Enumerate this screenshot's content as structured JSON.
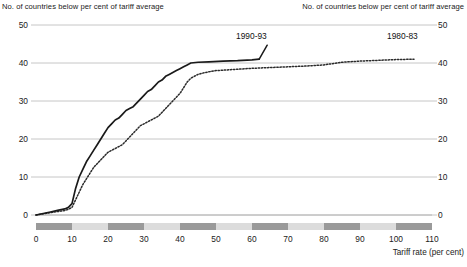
{
  "header": {
    "left_title": "No. of countries below per cent of tariff average",
    "right_title": "No. of countries below per cent of tariff average"
  },
  "axes": {
    "y_left_ticks": [
      "50",
      "40",
      "30",
      "20",
      "10",
      "0"
    ],
    "y_right_ticks": [
      "50",
      "40",
      "30",
      "20",
      "10",
      "0"
    ],
    "x_ticks": [
      "0",
      "10",
      "20",
      "30",
      "40",
      "50",
      "60",
      "70",
      "80",
      "90",
      "100",
      "110"
    ],
    "x_title": "Tariff rate (per cent)"
  },
  "series_labels": {
    "solid": "1990-93",
    "dotted": "1980-83"
  },
  "colors": {
    "line_solid": "#1a1a1a",
    "line_dotted": "#2b2b2b",
    "grid": "#b8b8b8",
    "band_dark": "#9a9a9a",
    "band_light": "#dcdcdc",
    "text": "#222222"
  },
  "chart_data": {
    "type": "line",
    "title": "No. of countries below per cent of tariff average",
    "xlabel": "Tariff rate (per cent)",
    "ylabel": "No. of countries below per cent of tariff average",
    "xlim": [
      0,
      110
    ],
    "ylim": [
      0,
      50
    ],
    "grid": true,
    "legend_position": "inline-annotation",
    "series": [
      {
        "name": "1990-93",
        "style": "solid",
        "x": [
          0,
          2,
          4,
          6,
          8,
          9,
          10,
          11,
          12,
          13,
          14,
          15,
          16,
          17,
          18,
          19,
          20,
          21,
          22,
          23,
          24,
          25,
          26,
          27,
          28,
          29,
          30,
          31,
          32,
          33,
          34,
          35,
          36,
          37,
          38,
          39,
          40,
          41,
          42,
          43,
          45,
          48,
          52,
          56,
          60,
          62
        ],
        "y": [
          0,
          0.4,
          0.8,
          1.2,
          1.6,
          2.0,
          3.0,
          7.0,
          10.0,
          12.0,
          14.0,
          15.5,
          17.0,
          18.5,
          20.0,
          21.5,
          23.0,
          24.0,
          25.0,
          25.5,
          26.5,
          27.5,
          28.0,
          28.5,
          29.5,
          30.5,
          31.5,
          32.5,
          33.0,
          34.0,
          35.0,
          35.5,
          36.5,
          37.0,
          37.5,
          38.0,
          38.5,
          39.0,
          39.5,
          40.0,
          40.2,
          40.3,
          40.5,
          40.6,
          40.8,
          41.0
        ]
      },
      {
        "name": "1980-83",
        "style": "dotted",
        "x": [
          0,
          2,
          4,
          6,
          8,
          9,
          10,
          11,
          12,
          13,
          14,
          15,
          16,
          17,
          18,
          19,
          20,
          21,
          22,
          23,
          24,
          25,
          26,
          27,
          28,
          29,
          30,
          31,
          32,
          33,
          34,
          35,
          36,
          37,
          38,
          39,
          40,
          41,
          42,
          43,
          45,
          47,
          50,
          55,
          60,
          65,
          70,
          75,
          80,
          85,
          90,
          95,
          100,
          105
        ],
        "y": [
          0,
          0.3,
          0.6,
          0.9,
          1.2,
          1.5,
          2.0,
          4.0,
          6.0,
          8.0,
          9.5,
          11.0,
          12.5,
          13.5,
          14.5,
          15.5,
          16.5,
          17.0,
          17.5,
          18.0,
          18.5,
          19.5,
          20.5,
          21.5,
          22.5,
          23.5,
          24.0,
          24.5,
          25.0,
          25.5,
          26.0,
          27.0,
          28.0,
          29.0,
          30.0,
          31.0,
          32.0,
          33.5,
          35.0,
          36.0,
          37.0,
          37.5,
          38.0,
          38.3,
          38.6,
          38.8,
          39.0,
          39.2,
          39.5,
          40.2,
          40.5,
          40.7,
          40.9,
          41.0
        ]
      }
    ]
  }
}
